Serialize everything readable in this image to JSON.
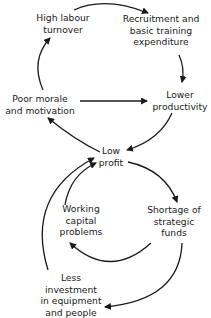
{
  "diagram": {
    "type": "causal-loop",
    "nodes": {
      "high_labour_turnover": [
        "High labour",
        "turnover"
      ],
      "recruitment_training": [
        "Recruitment and",
        "basic  training",
        "expenditure"
      ],
      "lower_productivity": [
        "Lower",
        "productivity"
      ],
      "poor_morale": [
        "Poor morale",
        "and motivation"
      ],
      "low_profit": [
        "Low",
        "profit"
      ],
      "working_capital": [
        "Working",
        "capital",
        "problems"
      ],
      "shortage_funds": [
        "Shortage of",
        "strategic",
        "funds"
      ],
      "less_investment": [
        "Less",
        "investment",
        "in equipment",
        "and people"
      ]
    },
    "edges": [
      {
        "from": "High labour turnover",
        "to": "Recruitment and basic training expenditure"
      },
      {
        "from": "Recruitment and basic training expenditure",
        "to": "Lower productivity"
      },
      {
        "from": "Poor morale and motivation",
        "to": "Lower productivity"
      },
      {
        "from": "Lower productivity",
        "to": "Low profit"
      },
      {
        "from": "Low profit",
        "to": "Poor morale and motivation"
      },
      {
        "from": "Poor morale and motivation",
        "to": "High labour turnover"
      },
      {
        "from": "Low profit",
        "to": "Shortage of strategic funds"
      },
      {
        "from": "Shortage of strategic funds",
        "to": "Working capital problems"
      },
      {
        "from": "Working capital problems",
        "to": "Low profit"
      },
      {
        "from": "Shortage of strategic funds",
        "to": "Less investment in equipment and people"
      },
      {
        "from": "Less investment in equipment and people",
        "to": "Low profit"
      }
    ]
  }
}
